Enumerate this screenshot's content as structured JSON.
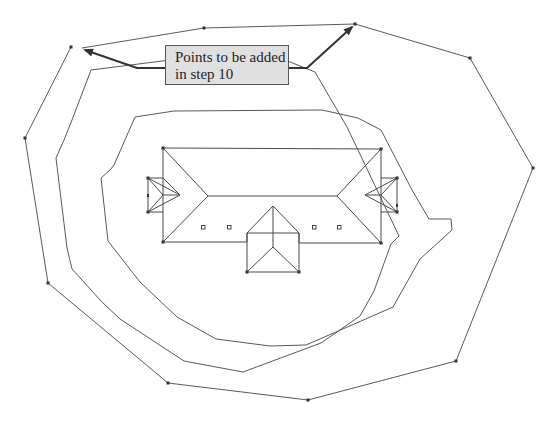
{
  "figure": {
    "type": "site plan with roof outline and offset contour polylines",
    "callout": {
      "lines": [
        "Points to be added",
        "in step 10"
      ],
      "background": "#e0e0e0",
      "arrow_targets": [
        [
          82,
          48
        ],
        [
          355,
          24
        ]
      ]
    },
    "colors": {
      "line": "#5a5a5a",
      "vertex": "#333333",
      "arrow": "#333333",
      "background": "#ffffff"
    },
    "outer_contour_points": [
      [
        48,
        0
      ],
      [
        79,
        48
      ],
      [
        204,
        28
      ],
      [
        355,
        24
      ],
      [
        470,
        58
      ],
      [
        533,
        168
      ],
      [
        456,
        361
      ],
      [
        308,
        400
      ],
      [
        168,
        383
      ],
      [
        48,
        283
      ],
      [
        25,
        138
      ],
      [
        79,
        48
      ]
    ],
    "middle_contour_points": [
      [
        72,
        76
      ],
      [
        170,
        62
      ],
      [
        265,
        53
      ],
      [
        315,
        72
      ],
      [
        347,
        127
      ],
      [
        399,
        237
      ],
      [
        374,
        291
      ],
      [
        321,
        371
      ],
      [
        243,
        359
      ],
      [
        184,
        361
      ],
      [
        120,
        319
      ],
      [
        72,
        269
      ],
      [
        67,
        248
      ],
      [
        56,
        158
      ],
      [
        72,
        76
      ]
    ],
    "inner_contour_points": [
      [
        135,
        117
      ],
      [
        174,
        112
      ],
      [
        322,
        110
      ],
      [
        358,
        118
      ],
      [
        381,
        130
      ],
      [
        412,
        190
      ],
      [
        451,
        219
      ],
      [
        451,
        230
      ],
      [
        422,
        271
      ],
      [
        393,
        308
      ],
      [
        352,
        325
      ],
      [
        306,
        345
      ],
      [
        270,
        346
      ],
      [
        216,
        339
      ],
      [
        177,
        317
      ],
      [
        138,
        282
      ],
      [
        108,
        241
      ],
      [
        99,
        178
      ],
      [
        103,
        172
      ],
      [
        114,
        165
      ],
      [
        135,
        117
      ]
    ],
    "roof": {
      "main_outline": [
        [
          163,
          148
        ],
        [
          381,
          149
        ],
        [
          381,
          243
        ],
        [
          163,
          242
        ]
      ],
      "ridge": [
        [
          208,
          196
        ],
        [
          337,
          196
        ]
      ],
      "hips": [
        [
          [
            163,
            148
          ],
          [
            208,
            196
          ]
        ],
        [
          [
            163,
            242
          ],
          [
            208,
            196
          ]
        ],
        [
          [
            381,
            149
          ],
          [
            337,
            196
          ]
        ],
        [
          [
            381,
            243
          ],
          [
            337,
            196
          ]
        ]
      ],
      "left_dormer": [
        [
          148,
          178
        ],
        [
          163,
          178
        ],
        [
          180,
          195
        ],
        [
          163,
          212
        ],
        [
          148,
          212
        ]
      ],
      "right_dormer": [
        [
          397,
          178
        ],
        [
          381,
          178
        ],
        [
          365,
          195
        ],
        [
          381,
          212
        ],
        [
          397,
          212
        ]
      ],
      "front_gable": {
        "outline": [
          [
            247,
            233
          ],
          [
            273,
            206
          ],
          [
            299,
            233
          ],
          [
            299,
            272
          ],
          [
            247,
            272
          ]
        ],
        "ridge_bottom": [
          273,
          247
        ]
      },
      "vents": [
        [
          203,
          227
        ],
        [
          229,
          227
        ],
        [
          314,
          227
        ],
        [
          339,
          227
        ]
      ]
    }
  }
}
